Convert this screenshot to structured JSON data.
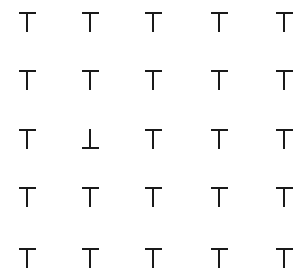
{
  "grid": {
    "rows": 5,
    "cols": 5,
    "col_centers": [
      27,
      90,
      153,
      219,
      284
    ],
    "row_centers": [
      22,
      80,
      139,
      197,
      258
    ],
    "stroke_color": "#1a1a1a",
    "background": "#ffffff",
    "cells": [
      [
        "T",
        "T",
        "T",
        "T",
        "T"
      ],
      [
        "T",
        "T",
        "T",
        "T",
        "T"
      ],
      [
        "T",
        "⊥",
        "T",
        "T",
        "T"
      ],
      [
        "T",
        "T",
        "T",
        "T",
        "T"
      ],
      [
        "T",
        "T",
        "T",
        "T",
        "T"
      ]
    ],
    "odd_one_out": {
      "row": 3,
      "col": 2,
      "glyph": "⊥"
    }
  }
}
